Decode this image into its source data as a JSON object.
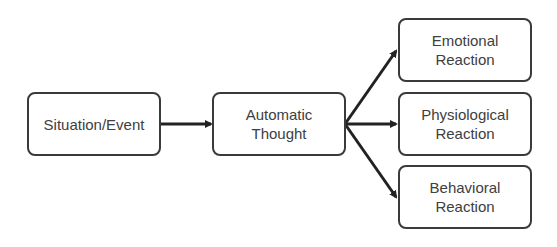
{
  "diagram": {
    "nodes": [
      {
        "id": "situation",
        "lines": [
          "Situation/Event"
        ]
      },
      {
        "id": "thought",
        "lines": [
          "Automatic",
          "Thought"
        ]
      },
      {
        "id": "emotional",
        "lines": [
          "Emotional",
          "Reaction"
        ]
      },
      {
        "id": "physiological",
        "lines": [
          "Physiological",
          "Reaction"
        ]
      },
      {
        "id": "behavioral",
        "lines": [
          "Behavioral",
          "Reaction"
        ]
      }
    ],
    "edges": [
      {
        "from": "situation",
        "to": "thought"
      },
      {
        "from": "thought",
        "to": "emotional"
      },
      {
        "from": "thought",
        "to": "physiological"
      },
      {
        "from": "thought",
        "to": "behavioral"
      }
    ],
    "colors": {
      "border": "#3a3a3a",
      "text": "#404040",
      "arrow": "#222222"
    }
  }
}
